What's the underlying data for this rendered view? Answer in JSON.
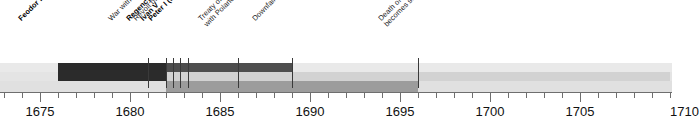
{
  "chart_data": {
    "type": "bar",
    "title": "",
    "xlabel": "",
    "ylabel": "",
    "xlim": [
      1672.8,
      1710.0
    ],
    "grid": false,
    "legend": "none",
    "axis": {
      "major_ticks": [
        1675,
        1680,
        1685,
        1690,
        1695,
        1700,
        1705
      ],
      "major_tick_labels": [
        "1675",
        "1680",
        "1685",
        "1690",
        "1695",
        "1700",
        "1705"
      ],
      "minor_tick_interval": 1,
      "pixels_per_year": 18.0,
      "year_at_x0": 1672.78
    },
    "bars": [
      {
        "name": "Feodor III",
        "label": "Feodor III",
        "start": 1676.0,
        "end": 1682.0,
        "row": "top",
        "color": "#2b2b2b"
      },
      {
        "name": "Regency of Sophia",
        "label": "Regency of Sophia",
        "start": 1682.0,
        "end": 1689.0,
        "row": "top",
        "color": "#4e4e4e"
      },
      {
        "name": "Peter I (the Great)",
        "label": "Peter I (the Great)",
        "start": 1682.0,
        "end": 1710.0,
        "row": "middle",
        "color": "#d2d2d2"
      },
      {
        "name": "Ivan V",
        "label": "Ivan V",
        "start": 1682.0,
        "end": 1696.0,
        "row": "bottom",
        "color": "#9c9c9c"
      }
    ],
    "events": [
      {
        "name": "feodor-iii",
        "label": "Feodor III",
        "year": 1676.0,
        "bold": true
      },
      {
        "name": "war-with-turkey-ends",
        "label": "War with Turkey ends",
        "year": 1681.0,
        "bold": false
      },
      {
        "name": "regency-of-sophia",
        "label": "Regency of Sophia",
        "year": 1682.0,
        "bold": true
      },
      {
        "name": "revolt-of-the-streltsy",
        "label": "Revolt of the Streltsy",
        "year": 1682.4,
        "bold": false
      },
      {
        "name": "ivan-v",
        "label": "Ivan V",
        "year": 1682.8,
        "bold": true
      },
      {
        "name": "peter-i-the-great",
        "label": "Peter I (the Great)",
        "year": 1683.2,
        "bold": true
      },
      {
        "name": "treaty-of-eternal-peace-with-poland",
        "label": "Treaty of Eternal Peace",
        "label2": "with Poland",
        "year": 1686.0,
        "bold": false
      },
      {
        "name": "downfall-of-sophia",
        "label": "Downfall of Sophia",
        "year": 1689.0,
        "bold": false
      },
      {
        "name": "death-of-ivan-peter-sole-ruler",
        "label": "Death of Ivan; Peter I",
        "label2": "becomes sole ruler",
        "year": 1696.0,
        "bold": false
      }
    ]
  },
  "axis": {
    "labels": [
      "1675",
      "1680",
      "1685",
      "1690",
      "1695",
      "1700",
      "1705"
    ]
  },
  "events": {
    "feodor": "Feodor III",
    "turkey": "War with Turkey ends",
    "regency": "Regency of Sophia",
    "streltsy": "Revolt of the Streltsy",
    "ivan": "Ivan V",
    "peter": "Peter I (the Great)",
    "treaty_l1": "Treaty of Eternal Peace",
    "treaty_l2": "with Poland",
    "downfall": "Downfall of Sophia",
    "death_l1": "Death of Ivan; Peter I",
    "death_l2": "becomes sole ruler"
  },
  "colors": {
    "feodor_bar": "#2b2b2b",
    "regency_bar": "#4e4e4e",
    "ivan_bar": "#9c9c9c",
    "peter_bar": "#d2d2d2",
    "band_background": "#e6e6e6",
    "axis": "#6e6e6e",
    "text": "#111111"
  }
}
